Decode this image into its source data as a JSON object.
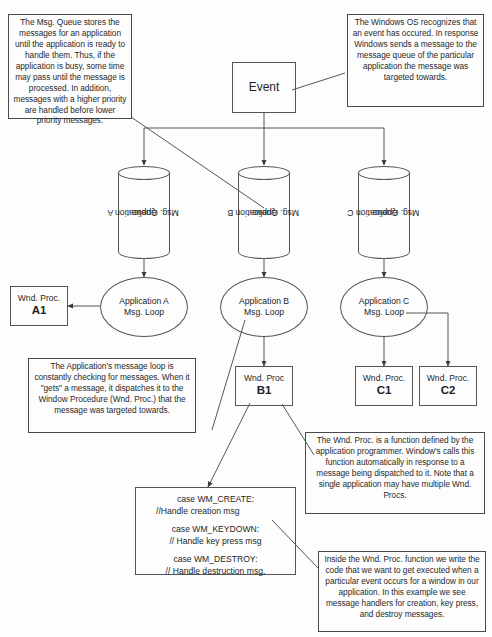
{
  "diagram": {
    "stroke_color": "#555555",
    "text_color": "#1f1f1f",
    "background": "#fdfdfd"
  },
  "annotations": {
    "msg_queue_note": "The Msg. Queue stores the messages for an application until the application is ready to handle them.  Thus, if the application is busy, some time may pass until the message is processed.  In addition, messages with a higher priority are handled before lower priority messages.",
    "windows_os_note": "The Windows OS recognizes that an event has occured.  In response Windows sends a message to the message queue of the particular application the message was targeted towards.",
    "message_loop_note": "The Application's message loop is constantly checking for messages.  When it \"gets\" a message, it dispatches it to the Window Procedure (Wnd. Proc.) that the message was targeted towards.",
    "wnd_proc_note": "The Wnd. Proc. is a function defined by the application programmer.  Window's calls this function automatically in response to a message being dispatched to it.  Note that a single application may have multiple Wnd. Procs.",
    "handlers_note": "Inside the Wnd. Proc. function we write the code that we want to get executed when a particular event occurs for a window in our application.  In this example we see message handlers for creation, key press, and destroy messages."
  },
  "event": {
    "label": "Event"
  },
  "queues": [
    {
      "line1": "Application A",
      "line2": "Msg. Queue"
    },
    {
      "line1": "Application B",
      "line2": "Msg. Queue"
    },
    {
      "line1": "Application C",
      "line2": "Msg. Queue"
    }
  ],
  "loops": [
    {
      "line1": "Application A",
      "line2": "Msg. Loop"
    },
    {
      "line1": "Application B",
      "line2": "Msg. Loop"
    },
    {
      "line1": "Application C",
      "line2": "Msg. Loop"
    }
  ],
  "wnd_procs": [
    {
      "title": "Wnd. Proc.",
      "name": "A1"
    },
    {
      "title": "Wnd. Proc",
      "name": "B1"
    },
    {
      "title": "Wnd. Proc.",
      "name": "C1"
    },
    {
      "title": "Wnd. Proc.",
      "name": "C2"
    }
  ],
  "code_box": {
    "case_create": "case WM_CREATE:",
    "comment_create": "//Handle creation msg",
    "case_keydown": "case WM_KEYDOWN:",
    "comment_keydown": "// Handle key press msg",
    "case_destroy": "case WM_DESTROY:",
    "comment_destroy": "// Handle destruction msg."
  }
}
